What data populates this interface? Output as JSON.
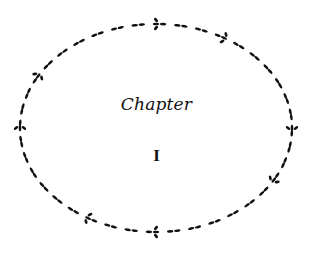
{
  "page": {
    "chapter_label": "Chapter",
    "chapter_number": "I",
    "ornament": "oval-vine-wreath-border",
    "ink_color": "#111111",
    "bleed_through_lines": [
      "",
      "",
      "",
      "",
      "",
      "",
      "",
      "",
      "",
      "",
      "",
      ""
    ]
  }
}
